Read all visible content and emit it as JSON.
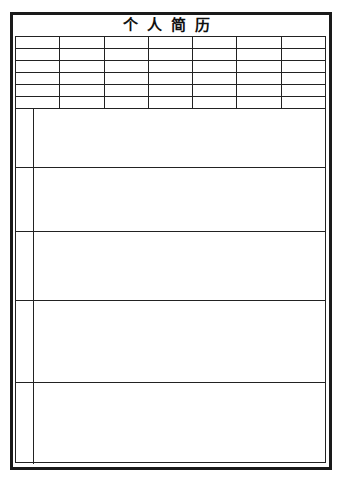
{
  "document": {
    "title": "个人简历",
    "border_color": "#1a1a1a"
  },
  "info_grid": {
    "columns": 7,
    "rows": [
      [
        "",
        "",
        "",
        "",
        "",
        "",
        ""
      ],
      [
        "",
        "",
        "",
        "",
        "",
        "",
        ""
      ],
      [
        "",
        "",
        "",
        "",
        "",
        "",
        ""
      ],
      [
        "",
        "",
        "",
        "",
        "",
        "",
        ""
      ],
      [
        "",
        "",
        "",
        "",
        "",
        "",
        ""
      ],
      [
        "",
        "",
        "",
        "",
        "",
        "",
        ""
      ]
    ]
  },
  "sections": [
    {
      "label": "",
      "content": ""
    },
    {
      "label": "",
      "content": ""
    },
    {
      "label": "",
      "content": ""
    },
    {
      "label": "",
      "content": ""
    },
    {
      "label": "",
      "content": ""
    }
  ]
}
